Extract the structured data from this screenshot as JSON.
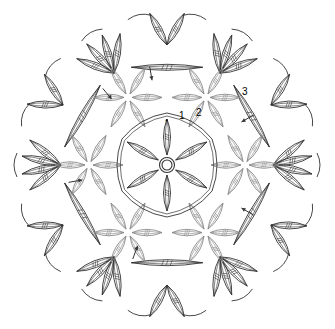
{
  "diagram": {
    "type": "crochet-chart",
    "center": {
      "element": "magic-ring"
    },
    "rounds": [
      {
        "label": "1",
        "color": "#333333",
        "petals": 6,
        "description": "6 cluster petals around center ring, hexagon chain outline"
      },
      {
        "label": "2",
        "color": "#8a8a8a",
        "clusters": 6,
        "petals_per_cluster": 6,
        "description": "gray flower clusters radiating from joins"
      },
      {
        "label": "3",
        "color": "#333333",
        "clusters": 6,
        "description": "outer dark fan clusters with chain loops"
      }
    ],
    "stroke_colors": {
      "dark": "#333333",
      "gray": "#8a8a8a"
    },
    "start_arrows": 6,
    "start_marker": "*"
  }
}
